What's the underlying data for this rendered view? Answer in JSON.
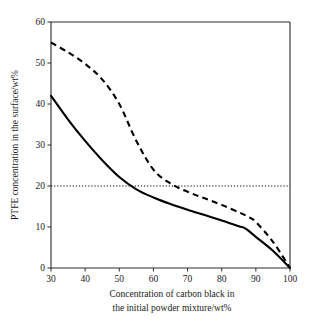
{
  "chart_data": {
    "type": "line",
    "title": "",
    "xlabel": "Concentration of carbon black in the initial powder mixture/wt%",
    "xlabel_line1": "Concentration of carbon black in",
    "xlabel_line2": "the initial powder mixture/wt%",
    "ylabel": "PTFE concentration in the surface/wt%",
    "xlim": [
      30,
      100
    ],
    "ylim": [
      0,
      60
    ],
    "xticks": [
      30,
      40,
      50,
      60,
      70,
      80,
      90,
      100
    ],
    "xtick_labels": [
      "30",
      "40",
      "50",
      "60",
      "70",
      "80",
      "90",
      "100"
    ],
    "yticks": [
      0,
      10,
      20,
      30,
      40,
      50,
      60
    ],
    "ytick_labels": [
      "0",
      "10",
      "20",
      "30",
      "40",
      "50",
      "60"
    ],
    "grid": false,
    "legend": null,
    "annotations": [
      {
        "name": "threshold-20",
        "type": "hline",
        "y": 20,
        "style": "dotted",
        "color": "#000000"
      }
    ],
    "series": [
      {
        "name": "solid-curve",
        "style": "solid",
        "color": "#000000",
        "x": [
          30,
          35,
          40,
          45,
          50,
          55,
          60,
          65,
          70,
          75,
          80,
          85,
          87,
          90,
          95,
          100
        ],
        "values": [
          42.0,
          36.2,
          31.0,
          26.3,
          22.2,
          19.2,
          17.2,
          15.6,
          14.2,
          12.9,
          11.6,
          10.2,
          9.6,
          7.6,
          4.2,
          0.0
        ]
      },
      {
        "name": "dashed-curve",
        "style": "dashed",
        "color": "#000000",
        "x": [
          30,
          35,
          40,
          45,
          50,
          55,
          60,
          65,
          70,
          75,
          80,
          85,
          88,
          90,
          95,
          100
        ],
        "values": [
          55.0,
          52.6,
          49.8,
          46.0,
          40.0,
          31.0,
          24.0,
          20.6,
          18.6,
          17.0,
          15.4,
          13.6,
          12.4,
          11.2,
          6.4,
          0.0
        ]
      }
    ]
  },
  "axes": {
    "y_axis_title": "PTFE concentration in the surface/wt%",
    "x_axis_title_line1": "Concentration of carbon black in",
    "x_axis_title_line2": "the initial powder mixture/wt%"
  }
}
